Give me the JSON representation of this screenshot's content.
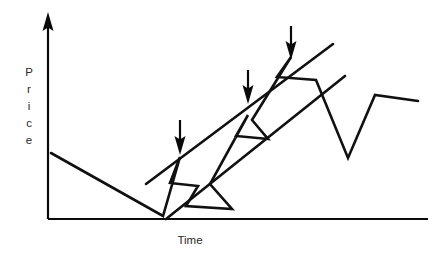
{
  "figure": {
    "width": 441,
    "height": 261,
    "background": "#ffffff",
    "stroke_color": "#111111",
    "text_color": "#2a2a2a"
  },
  "axes": {
    "y_label": "Price",
    "y_label_letters": [
      "P",
      "r",
      "i",
      "c",
      "e"
    ],
    "x_label": "Time",
    "y_axis_arrow": "up-arrow-icon",
    "origin": {
      "x": 48,
      "y": 219
    },
    "y_top": 15,
    "x_right": 428
  },
  "chart_data": {
    "type": "line",
    "title": "",
    "xlabel": "Time",
    "ylabel": "Price",
    "xlim": [
      48,
      428
    ],
    "ylim": [
      219,
      15
    ],
    "grid": false,
    "legend": "none",
    "series": [
      {
        "name": "price",
        "points": [
          [
            51,
            153
          ],
          [
            163,
            216
          ],
          [
            180,
            157
          ],
          [
            170,
            183
          ],
          [
            198,
            186
          ],
          [
            186,
            206
          ],
          [
            232,
            209
          ],
          [
            210,
            184
          ],
          [
            248,
            115
          ],
          [
            236,
            136
          ],
          [
            268,
            139
          ],
          [
            252,
            120
          ],
          [
            291,
            57
          ],
          [
            277,
            77
          ],
          [
            316,
            80
          ],
          [
            348,
            158
          ],
          [
            375,
            95
          ],
          [
            418,
            101
          ]
        ]
      }
    ],
    "channel_lines": [
      {
        "name": "upper-trendline",
        "x1": 146,
        "y1": 184,
        "x2": 333,
        "y2": 44
      },
      {
        "name": "lower-trendline",
        "x1": 166,
        "y1": 219,
        "x2": 345,
        "y2": 76
      }
    ],
    "annotations": [
      {
        "name": "arrow-marker-1",
        "x": 180,
        "y_top": 120,
        "y_tip": 155
      },
      {
        "name": "arrow-marker-2",
        "x": 248,
        "y_top": 70,
        "y_tip": 104
      },
      {
        "name": "arrow-marker-3",
        "x": 291,
        "y_top": 26,
        "y_tip": 60
      }
    ]
  }
}
